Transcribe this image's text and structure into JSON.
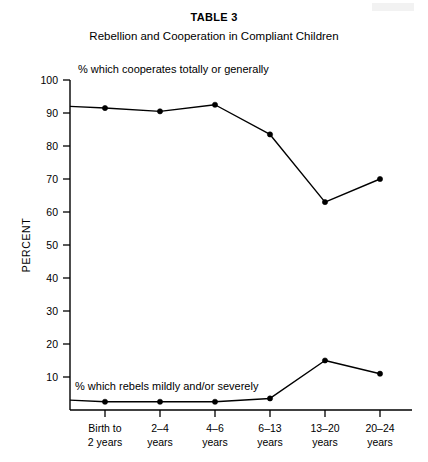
{
  "figure": {
    "table_label": "TABLE 3",
    "caption": "Rebellion and Cooperation in Compliant Children"
  },
  "chart_data": {
    "type": "line",
    "title": "Rebellion and Cooperation in Compliant Children",
    "subtitle": "TABLE 3",
    "xlabel": "",
    "ylabel": "PERCENT",
    "ylim": [
      0,
      100
    ],
    "yticks": [
      10,
      20,
      30,
      40,
      50,
      60,
      70,
      80,
      90,
      100
    ],
    "grid": false,
    "legend_position": "inline-annotation",
    "categories": [
      "Birth to 2 years",
      "2-4 years",
      "4-6 years",
      "6-13 years",
      "13-20 years",
      "20-24 years"
    ],
    "category_lines": [
      [
        "Birth to",
        "2 years"
      ],
      [
        "2–4",
        "years"
      ],
      [
        "4–6",
        "years"
      ],
      [
        "6–13",
        "years"
      ],
      [
        "13–20",
        "years"
      ],
      [
        "20–24",
        "years"
      ]
    ],
    "series": [
      {
        "name": "% which cooperates totally or generally",
        "annotation": "% which cooperates totally or generally",
        "values": [
          91.5,
          90.5,
          92.5,
          83.5,
          63,
          70
        ],
        "axis_start_value": 92
      },
      {
        "name": "% which rebels mildly and/or severely",
        "annotation": "% which rebels mildly and/or severely",
        "values": [
          2.5,
          2.5,
          2.5,
          3.5,
          15,
          11
        ],
        "axis_start_value": 3
      }
    ],
    "colors": {
      "line": "#000000",
      "marker": "#000000",
      "axis": "#000000",
      "background": "#ffffff"
    }
  },
  "annotations": {
    "upper": "% which cooperates totally or generally",
    "lower": "% which rebels mildly and/or severely"
  },
  "axis": {
    "y_title": "PERCENT",
    "y_tick_labels": [
      "100",
      "90",
      "80",
      "70",
      "60",
      "50",
      "40",
      "30",
      "20",
      "10"
    ]
  }
}
